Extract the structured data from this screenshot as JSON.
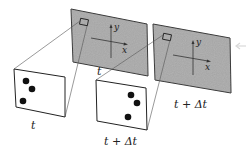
{
  "diagram": {
    "colors": {
      "image_plane_fill": "#a9a9a9",
      "outline": "#333333",
      "dot": "#111111",
      "background": "#ffffff"
    },
    "image_planes": [
      {
        "id": "frame-t",
        "label": "t",
        "corners": [
          [
            71,
            9
          ],
          [
            147,
            24
          ],
          [
            148,
            76
          ],
          [
            73,
            62
          ]
        ],
        "window": {
          "x": 80,
          "y": 20,
          "w": 8,
          "h": 6
        },
        "axes": {
          "y_label": "y",
          "x_label": "x"
        }
      },
      {
        "id": "frame-t-dt",
        "label": "t + Δt",
        "corners": [
          [
            153,
            24
          ],
          [
            230,
            38
          ],
          [
            231,
            93
          ],
          [
            155,
            80
          ]
        ],
        "window": {
          "x": 163,
          "y": 34,
          "w": 8,
          "h": 6
        },
        "axes": {
          "y_label": "y",
          "x_label": "x"
        }
      }
    ],
    "magnified_windows": [
      {
        "id": "zoom-t",
        "label": "t",
        "corners": [
          [
            14,
            69
          ],
          [
            65,
            77
          ],
          [
            65,
            117
          ],
          [
            16,
            107
          ]
        ],
        "dots": [
          [
            26,
            81
          ],
          [
            32,
            89
          ],
          [
            23,
            101
          ]
        ]
      },
      {
        "id": "zoom-t-dt",
        "label": "t + Δt",
        "corners": [
          [
            96,
            80
          ],
          [
            146,
            88
          ],
          [
            147,
            130
          ],
          [
            97,
            121
          ]
        ],
        "dots": [
          [
            131,
            95
          ],
          [
            137,
            103
          ],
          [
            128,
            117
          ]
        ]
      }
    ]
  }
}
